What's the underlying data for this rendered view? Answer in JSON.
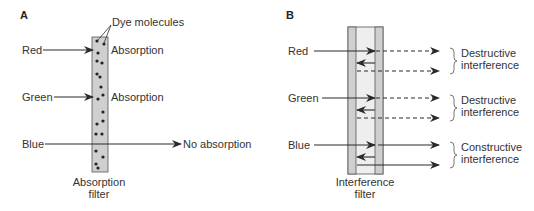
{
  "colors": {
    "line": "#2a2a2a",
    "text": "#333333",
    "filter_fill": "#cfcfcf",
    "filter_inner": "#eeeeee",
    "dot": "#222222"
  },
  "panel_a": {
    "label": "A",
    "dye_label": "Dye molecules",
    "filter_label_line1": "Absorption",
    "filter_label_line2": "filter",
    "rays": [
      {
        "color": "Red",
        "result": "Absorption"
      },
      {
        "color": "Green",
        "result": "Absorption"
      },
      {
        "color": "Blue",
        "result": "No absorption"
      }
    ]
  },
  "panel_b": {
    "label": "B",
    "filter_label_line1": "Interference",
    "filter_label_line2": "filter",
    "rays": [
      {
        "color": "Red",
        "result_line1": "Destructive",
        "result_line2": "interference",
        "style": "dashed"
      },
      {
        "color": "Green",
        "result_line1": "Destructive",
        "result_line2": "interference",
        "style": "dashed"
      },
      {
        "color": "Blue",
        "result_line1": "Constructive",
        "result_line2": "interference",
        "style": "solid"
      }
    ]
  }
}
